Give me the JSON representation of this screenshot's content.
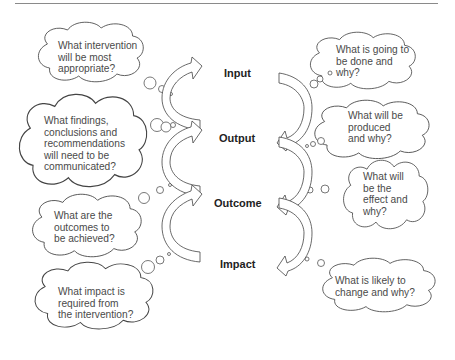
{
  "stages": [
    {
      "label": "Input"
    },
    {
      "label": "Output"
    },
    {
      "label": "Outcome"
    },
    {
      "label": "Impact"
    }
  ],
  "left_clouds": [
    {
      "text": "What intervention\nwill be most\nappropriate?"
    },
    {
      "text": "What findings,\nconclusions and\nrecommendations\nwill need to be\ncommunicated?"
    },
    {
      "text": "What are the\noutcomes to\nbe achieved?"
    },
    {
      "text": "What impact is\nrequired from\nthe intervention?"
    }
  ],
  "right_clouds": [
    {
      "text": "What is going to\nbe done and\nwhy?"
    },
    {
      "text": "What will be\nproduced\nand why?"
    },
    {
      "text": "What will\nbe the\neffect and\nwhy?"
    },
    {
      "text": "What is likely to\nchange and why?"
    }
  ],
  "colors": {
    "stroke": "#444444",
    "text": "#4a4a4a",
    "label": "#222222",
    "rule": "#8a8a8a"
  }
}
